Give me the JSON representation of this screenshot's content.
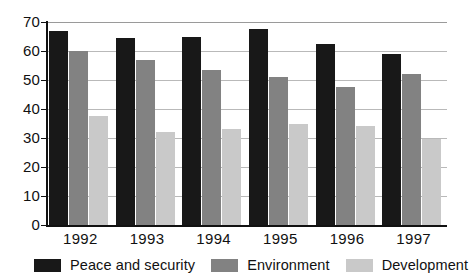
{
  "chart_data": {
    "type": "bar",
    "title": "",
    "subtitle": "",
    "xlabel": "",
    "ylabel": "",
    "categories": [
      "1992",
      "1993",
      "1994",
      "1995",
      "1996",
      "1997"
    ],
    "series": [
      {
        "name": "Peace and security",
        "color": "#181818",
        "values": [
          67,
          64.5,
          65,
          67.5,
          62.5,
          59
        ]
      },
      {
        "name": "Environment",
        "color": "#828282",
        "values": [
          60,
          57,
          53.5,
          51,
          47.5,
          52
        ]
      },
      {
        "name": "Development",
        "color": "#c9c9c9",
        "values": [
          37.5,
          32,
          33,
          35,
          34,
          29.5
        ]
      }
    ],
    "ylim": [
      0,
      70
    ],
    "ytick_step": 10,
    "yticks": [
      "70",
      "60",
      "50",
      "40",
      "30",
      "20",
      "10",
      "0"
    ],
    "grid": true,
    "grid_axis": "y",
    "legend_position": "bottom",
    "bar_mode": "grouped"
  },
  "axes": {
    "y_tick_labels": [
      "70",
      "60",
      "50",
      "40",
      "30",
      "20",
      "10",
      "0"
    ],
    "x_tick_labels": [
      "1992",
      "1993",
      "1994",
      "1995",
      "1996",
      "1997"
    ]
  },
  "legend": {
    "items": [
      {
        "label": "Peace and security",
        "color": "#181818"
      },
      {
        "label": "Environment",
        "color": "#828282"
      },
      {
        "label": "Development",
        "color": "#c9c9c9"
      }
    ]
  },
  "colors": {
    "series_1": "#181818",
    "series_2": "#828282",
    "series_3": "#c9c9c9",
    "axis": "#111111",
    "gridline": "#b9b9b9",
    "background": "#ffffff"
  }
}
